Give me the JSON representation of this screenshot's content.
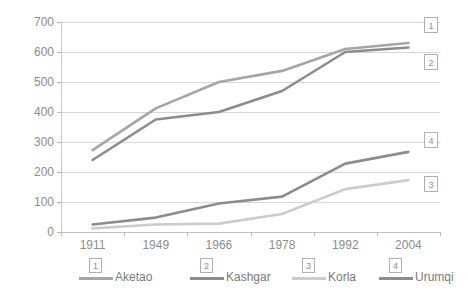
{
  "chart_data": {
    "type": "line",
    "title": "",
    "xlabel": "",
    "ylabel": "",
    "categories": [
      "1911",
      "1949",
      "1966",
      "1978",
      "1992",
      "2004"
    ],
    "ylim": [
      0,
      700
    ],
    "ytick_labels": [
      "0",
      "100",
      "200",
      "300",
      "400",
      "500",
      "600",
      "700"
    ],
    "ytick_values": [
      0,
      100,
      200,
      300,
      400,
      500,
      600,
      700
    ],
    "grid": true,
    "legend_position": "bottom",
    "series": [
      {
        "name": "Aketao",
        "badge": "1",
        "color": "#a6a6a6",
        "values": [
          273,
          412,
          500,
          537,
          610,
          630
        ]
      },
      {
        "name": "Kashgar",
        "badge": "2",
        "color": "#8c8c8c",
        "values": [
          240,
          375,
          400,
          470,
          600,
          615
        ]
      },
      {
        "name": "Korla",
        "badge": "3",
        "color": "#cccccc",
        "values": [
          12,
          25,
          28,
          60,
          143,
          173
        ]
      },
      {
        "name": "Urumqi",
        "badge": "4",
        "color": "#8c8c8c",
        "values": [
          25,
          48,
          95,
          118,
          228,
          267
        ]
      }
    ],
    "end_callouts": [
      {
        "badge": "1",
        "series": "Aketao"
      },
      {
        "badge": "2",
        "series": "Kashgar"
      },
      {
        "badge": "3",
        "series": "Korla"
      },
      {
        "badge": "4",
        "series": "Urumqi"
      }
    ]
  },
  "legend": {
    "items": [
      {
        "badge": "1",
        "label": "Aketao"
      },
      {
        "badge": "2",
        "label": "Kashgar"
      },
      {
        "badge": "3",
        "label": "Korla"
      },
      {
        "badge": "4",
        "label": "Urumqi"
      }
    ]
  }
}
